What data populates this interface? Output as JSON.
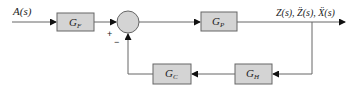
{
  "diagram": {
    "type": "feedback-control-block-diagram",
    "input_label": "A(s)",
    "output_label": "Z(s), Z̈(s), Ẍ(s)",
    "summing_junction": {
      "plus_sign": "+",
      "minus_sign": "−"
    },
    "blocks": [
      {
        "id": "gf",
        "main": "G",
        "sub": "F"
      },
      {
        "id": "gp",
        "main": "G",
        "sub": "P"
      },
      {
        "id": "gc",
        "main": "G",
        "sub": "C"
      },
      {
        "id": "gh",
        "main": "G",
        "sub": "H"
      }
    ],
    "connections": [
      "A(s) → G_F",
      "G_F → summing junction (+)",
      "summing junction → G_P",
      "G_P → output Z(s), Z̈(s), Ẍ(s)",
      "output → G_H",
      "G_H → G_C",
      "G_C → summing junction (−)"
    ],
    "colors": {
      "block_fill": "#d4d4d4",
      "line": "#666666",
      "text": "#222222"
    }
  }
}
